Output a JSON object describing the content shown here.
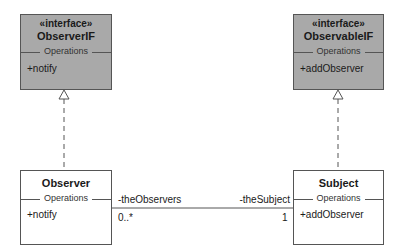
{
  "diagram": {
    "observer_if": {
      "stereotype": "«interface»",
      "name": "ObserverIF",
      "section": "Operations",
      "operations": [
        "+notify"
      ]
    },
    "observable_if": {
      "stereotype": "«interface»",
      "name": "ObservableIF",
      "section": "Operations",
      "operations": [
        "+addObserver"
      ]
    },
    "observer": {
      "name": "Observer",
      "section": "Operations",
      "operations": [
        "+notify"
      ]
    },
    "subject": {
      "name": "Subject",
      "section": "Operations",
      "operations": [
        "+addObserver"
      ]
    },
    "association": {
      "left_role": "-theObservers",
      "left_multiplicity": "0..*",
      "right_role": "-theSubject",
      "right_multiplicity": "1"
    },
    "colors": {
      "interface_fill": "#a9a9a9",
      "class_fill": "#ffffff",
      "line": "#555555"
    }
  }
}
